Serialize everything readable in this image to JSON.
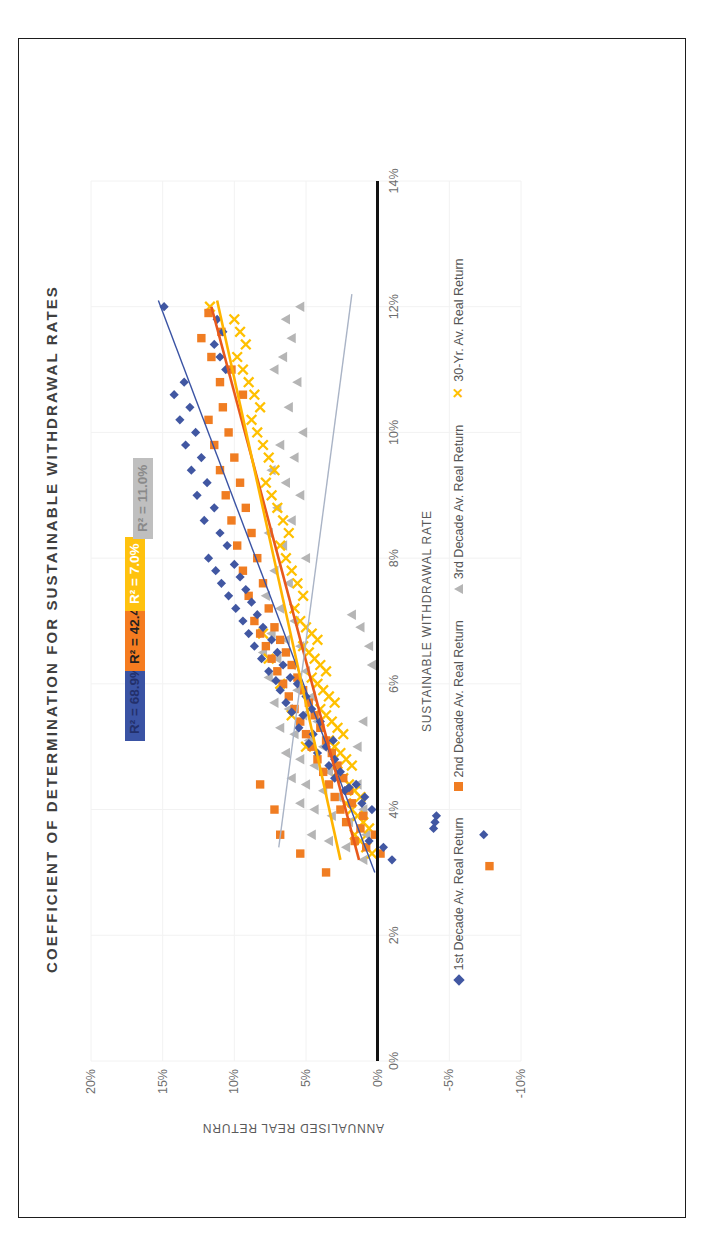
{
  "chart_data": {
    "type": "scatter",
    "title": "COEFFICIENT OF DETERMINATION FOR SUSTAINABLE WITHDRAWAL RATES",
    "xlabel": "SUSTAINABLE WITHDRAWAL RATE",
    "ylabel": "ANNUALISED REAL RETURN",
    "xlim": [
      0,
      14
    ],
    "ylim": [
      -10,
      20
    ],
    "xticks": [
      "0%",
      "2%",
      "4%",
      "6%",
      "8%",
      "10%",
      "12%",
      "14%"
    ],
    "xtick_values": [
      0,
      2,
      4,
      6,
      8,
      10,
      12,
      14
    ],
    "yticks": [
      "-10%",
      "-5%",
      "0%",
      "5%",
      "10%",
      "15%",
      "20%"
    ],
    "ytick_values": [
      -10,
      -5,
      0,
      5,
      10,
      15,
      20
    ],
    "grid": true,
    "legend_position": "bottom",
    "annotations": [
      {
        "label": "R² = 68.9%",
        "series": "1st Decade Av. Real Return",
        "color": "#3a53a4"
      },
      {
        "label": "R² = 42.4%",
        "series": "2nd Decade Av. Real Return",
        "color": "#f57c20"
      },
      {
        "label": "R² = 7.0%",
        "series": "30-Yr. Av. Real Return",
        "color": "#ffc20e"
      },
      {
        "label": "R² = 11.0%",
        "series": "3rd Decade Av. Real Return",
        "color": "#bfbfbf"
      }
    ],
    "series": [
      {
        "name": "1st Decade Av. Real Return",
        "color": "#4157a2",
        "marker": "diamond",
        "r_squared": 68.9,
        "trendline": {
          "x": [
            3.0,
            12.1
          ],
          "y": [
            0.2,
            15.3
          ],
          "color": "#3a53a4"
        },
        "points": [
          [
            3.2,
            -1.0
          ],
          [
            3.4,
            -0.4
          ],
          [
            3.5,
            0.6
          ],
          [
            3.6,
            -7.4
          ],
          [
            3.7,
            -3.9
          ],
          [
            3.8,
            -4.0
          ],
          [
            3.9,
            -4.1
          ],
          [
            4.0,
            0.4
          ],
          [
            4.1,
            1.1
          ],
          [
            4.2,
            0.9
          ],
          [
            4.3,
            2.3
          ],
          [
            4.35,
            2.0
          ],
          [
            4.4,
            1.5
          ],
          [
            4.5,
            3.0
          ],
          [
            4.6,
            2.6
          ],
          [
            4.7,
            3.4
          ],
          [
            4.8,
            3.0
          ],
          [
            4.9,
            4.2
          ],
          [
            5.0,
            3.6
          ],
          [
            5.05,
            4.8
          ],
          [
            5.1,
            3.1
          ],
          [
            5.2,
            4.5
          ],
          [
            5.3,
            5.5
          ],
          [
            5.4,
            4.0
          ],
          [
            5.5,
            5.2
          ],
          [
            5.55,
            6.0
          ],
          [
            5.6,
            4.6
          ],
          [
            5.7,
            6.4
          ],
          [
            5.8,
            5.0
          ],
          [
            5.9,
            6.8
          ],
          [
            6.0,
            5.6
          ],
          [
            6.05,
            7.1
          ],
          [
            6.1,
            6.1
          ],
          [
            6.2,
            7.6
          ],
          [
            6.3,
            6.6
          ],
          [
            6.4,
            8.1
          ],
          [
            6.5,
            7.0
          ],
          [
            6.6,
            8.6
          ],
          [
            6.7,
            7.4
          ],
          [
            6.8,
            9.0
          ],
          [
            6.9,
            8.0
          ],
          [
            7.0,
            9.4
          ],
          [
            7.1,
            8.4
          ],
          [
            7.2,
            9.9
          ],
          [
            7.3,
            8.8
          ],
          [
            7.4,
            10.4
          ],
          [
            7.5,
            9.2
          ],
          [
            7.6,
            10.9
          ],
          [
            7.7,
            9.6
          ],
          [
            7.8,
            11.3
          ],
          [
            7.9,
            10.0
          ],
          [
            8.0,
            11.8
          ],
          [
            8.2,
            10.5
          ],
          [
            8.4,
            11.0
          ],
          [
            8.6,
            12.1
          ],
          [
            8.8,
            11.4
          ],
          [
            9.0,
            12.6
          ],
          [
            9.2,
            11.9
          ],
          [
            9.4,
            13.0
          ],
          [
            9.6,
            12.3
          ],
          [
            9.8,
            13.4
          ],
          [
            10.0,
            12.7
          ],
          [
            10.2,
            13.8
          ],
          [
            10.4,
            13.1
          ],
          [
            10.6,
            14.2
          ],
          [
            10.8,
            13.5
          ],
          [
            11.0,
            10.6
          ],
          [
            11.2,
            11.0
          ],
          [
            11.4,
            11.4
          ],
          [
            11.6,
            10.8
          ],
          [
            11.8,
            11.2
          ],
          [
            12.0,
            14.9
          ]
        ]
      },
      {
        "name": "2nd Decade Av. Real Return",
        "color": "#f07d22",
        "marker": "square",
        "r_squared": 42.4,
        "trendline": {
          "x": [
            3.2,
            12.0
          ],
          "y": [
            1.3,
            11.6
          ],
          "color": "#e8591c"
        },
        "points": [
          [
            3.1,
            -7.8
          ],
          [
            3.3,
            -0.2
          ],
          [
            3.4,
            0.8
          ],
          [
            3.5,
            1.6
          ],
          [
            3.6,
            0.2
          ],
          [
            3.7,
            1.2
          ],
          [
            3.8,
            2.2
          ],
          [
            3.9,
            1.0
          ],
          [
            4.0,
            2.6
          ],
          [
            4.1,
            1.8
          ],
          [
            4.2,
            3.0
          ],
          [
            4.3,
            2.0
          ],
          [
            4.4,
            3.4
          ],
          [
            4.5,
            2.4
          ],
          [
            4.6,
            3.8
          ],
          [
            4.7,
            2.8
          ],
          [
            4.8,
            4.2
          ],
          [
            4.9,
            3.2
          ],
          [
            5.0,
            4.6
          ],
          [
            5.1,
            3.6
          ],
          [
            5.2,
            5.0
          ],
          [
            5.3,
            4.0
          ],
          [
            5.4,
            5.4
          ],
          [
            5.5,
            4.4
          ],
          [
            5.6,
            5.8
          ],
          [
            5.7,
            4.8
          ],
          [
            5.8,
            6.2
          ],
          [
            5.9,
            5.2
          ],
          [
            6.0,
            6.6
          ],
          [
            6.1,
            5.6
          ],
          [
            6.2,
            7.0
          ],
          [
            6.3,
            6.0
          ],
          [
            6.4,
            7.4
          ],
          [
            6.5,
            6.4
          ],
          [
            6.6,
            7.8
          ],
          [
            6.7,
            6.8
          ],
          [
            6.8,
            8.2
          ],
          [
            6.9,
            7.2
          ],
          [
            7.0,
            8.6
          ],
          [
            7.2,
            7.6
          ],
          [
            7.4,
            9.0
          ],
          [
            7.6,
            8.0
          ],
          [
            7.8,
            9.4
          ],
          [
            8.0,
            8.4
          ],
          [
            8.2,
            9.8
          ],
          [
            8.4,
            8.8
          ],
          [
            8.6,
            10.2
          ],
          [
            8.8,
            9.2
          ],
          [
            9.0,
            10.6
          ],
          [
            9.2,
            9.6
          ],
          [
            9.4,
            11.0
          ],
          [
            9.6,
            10.0
          ],
          [
            9.8,
            11.4
          ],
          [
            10.0,
            10.4
          ],
          [
            10.2,
            11.8
          ],
          [
            10.4,
            10.8
          ],
          [
            10.6,
            9.4
          ],
          [
            10.8,
            11.0
          ],
          [
            11.0,
            10.2
          ],
          [
            11.2,
            11.6
          ],
          [
            11.5,
            12.3
          ],
          [
            11.6,
            10.9
          ],
          [
            11.9,
            11.8
          ],
          [
            3.0,
            3.6
          ],
          [
            3.3,
            5.4
          ],
          [
            3.6,
            6.8
          ],
          [
            4.0,
            7.2
          ],
          [
            4.4,
            8.2
          ]
        ]
      },
      {
        "name": "3rd Decade Av. Real Return",
        "color": "#b5b5b5",
        "marker": "triangle",
        "r_squared": 11.0,
        "trendline": {
          "x": [
            3.4,
            12.2
          ],
          "y": [
            6.9,
            1.8
          ],
          "color": "#aab4c6"
        },
        "points": [
          [
            3.2,
            1.0
          ],
          [
            3.4,
            2.2
          ],
          [
            3.5,
            3.4
          ],
          [
            3.6,
            4.6
          ],
          [
            3.8,
            2.0
          ],
          [
            3.9,
            3.2
          ],
          [
            4.0,
            4.4
          ],
          [
            4.1,
            5.4
          ],
          [
            4.2,
            2.8
          ],
          [
            4.3,
            3.8
          ],
          [
            4.4,
            5.0
          ],
          [
            4.5,
            6.0
          ],
          [
            4.6,
            3.4
          ],
          [
            4.7,
            4.4
          ],
          [
            4.8,
            5.4
          ],
          [
            4.9,
            6.4
          ],
          [
            5.0,
            3.8
          ],
          [
            5.1,
            4.8
          ],
          [
            5.2,
            5.8
          ],
          [
            5.3,
            6.8
          ],
          [
            5.4,
            4.2
          ],
          [
            5.5,
            5.2
          ],
          [
            5.6,
            6.2
          ],
          [
            5.7,
            7.2
          ],
          [
            5.8,
            4.6
          ],
          [
            5.9,
            5.6
          ],
          [
            6.0,
            6.6
          ],
          [
            6.1,
            7.6
          ],
          [
            6.2,
            5.0
          ],
          [
            6.3,
            6.0
          ],
          [
            6.4,
            7.0
          ],
          [
            6.5,
            8.0
          ],
          [
            6.6,
            5.4
          ],
          [
            6.7,
            6.4
          ],
          [
            6.8,
            7.4
          ],
          [
            7.0,
            5.8
          ],
          [
            7.2,
            6.8
          ],
          [
            7.4,
            7.8
          ],
          [
            7.6,
            6.2
          ],
          [
            7.8,
            7.2
          ],
          [
            8.0,
            5.0
          ],
          [
            8.2,
            6.6
          ],
          [
            8.4,
            7.6
          ],
          [
            8.6,
            6.0
          ],
          [
            8.8,
            7.0
          ],
          [
            9.0,
            5.4
          ],
          [
            9.2,
            6.4
          ],
          [
            9.4,
            7.4
          ],
          [
            9.6,
            5.8
          ],
          [
            9.8,
            6.8
          ],
          [
            10.0,
            5.2
          ],
          [
            10.4,
            6.2
          ],
          [
            10.8,
            5.6
          ],
          [
            11.0,
            7.2
          ],
          [
            11.2,
            6.6
          ],
          [
            11.5,
            6.0
          ],
          [
            11.8,
            6.4
          ],
          [
            12.0,
            5.4
          ],
          [
            6.3,
            0.4
          ],
          [
            6.6,
            0.6
          ],
          [
            6.9,
            1.2
          ],
          [
            7.1,
            1.8
          ],
          [
            5.0,
            1.4
          ],
          [
            5.4,
            1.0
          ],
          [
            4.4,
            1.4
          ],
          [
            4.0,
            1.0
          ],
          [
            3.6,
            0.8
          ]
        ]
      },
      {
        "name": "30-Yr. Av. Real Return",
        "color": "#ffc000",
        "marker": "x",
        "r_squared": 7.0,
        "trendline": {
          "x": [
            3.2,
            12.1
          ],
          "y": [
            2.6,
            11.2
          ],
          "color": "#ffb400"
        },
        "points": [
          [
            3.3,
            0.4
          ],
          [
            3.4,
            0.8
          ],
          [
            3.5,
            1.2
          ],
          [
            3.6,
            1.6
          ],
          [
            3.7,
            0.6
          ],
          [
            3.8,
            1.0
          ],
          [
            3.9,
            1.4
          ],
          [
            4.0,
            1.8
          ],
          [
            4.1,
            2.2
          ],
          [
            4.2,
            1.2
          ],
          [
            4.3,
            1.6
          ],
          [
            4.4,
            2.0
          ],
          [
            4.5,
            2.4
          ],
          [
            4.6,
            2.8
          ],
          [
            4.7,
            1.8
          ],
          [
            4.8,
            2.2
          ],
          [
            4.9,
            2.6
          ],
          [
            5.0,
            3.0
          ],
          [
            5.1,
            3.4
          ],
          [
            5.2,
            2.4
          ],
          [
            5.3,
            2.8
          ],
          [
            5.4,
            3.2
          ],
          [
            5.5,
            3.6
          ],
          [
            5.6,
            4.0
          ],
          [
            5.7,
            3.0
          ],
          [
            5.8,
            3.4
          ],
          [
            5.9,
            3.8
          ],
          [
            6.0,
            4.2
          ],
          [
            6.1,
            4.6
          ],
          [
            6.2,
            3.6
          ],
          [
            6.3,
            4.0
          ],
          [
            6.4,
            4.4
          ],
          [
            6.5,
            4.8
          ],
          [
            6.6,
            5.2
          ],
          [
            6.7,
            4.2
          ],
          [
            6.8,
            4.6
          ],
          [
            6.9,
            5.0
          ],
          [
            7.0,
            5.4
          ],
          [
            7.2,
            5.8
          ],
          [
            7.4,
            5.2
          ],
          [
            7.6,
            5.6
          ],
          [
            7.8,
            6.0
          ],
          [
            8.0,
            6.4
          ],
          [
            8.2,
            6.8
          ],
          [
            8.4,
            6.2
          ],
          [
            8.6,
            6.6
          ],
          [
            8.8,
            7.0
          ],
          [
            9.0,
            7.4
          ],
          [
            9.2,
            7.8
          ],
          [
            9.4,
            7.2
          ],
          [
            9.6,
            7.6
          ],
          [
            9.8,
            8.0
          ],
          [
            10.0,
            8.4
          ],
          [
            10.2,
            8.8
          ],
          [
            10.4,
            8.2
          ],
          [
            10.6,
            8.6
          ],
          [
            10.8,
            9.0
          ],
          [
            11.0,
            9.4
          ],
          [
            11.2,
            9.8
          ],
          [
            11.4,
            9.2
          ],
          [
            11.6,
            9.6
          ],
          [
            11.8,
            10.0
          ],
          [
            12.0,
            11.7
          ],
          [
            5.0,
            5.0
          ],
          [
            5.5,
            6.0
          ],
          [
            6.0,
            6.8
          ],
          [
            6.4,
            7.6
          ],
          [
            6.8,
            8.0
          ]
        ]
      }
    ]
  }
}
